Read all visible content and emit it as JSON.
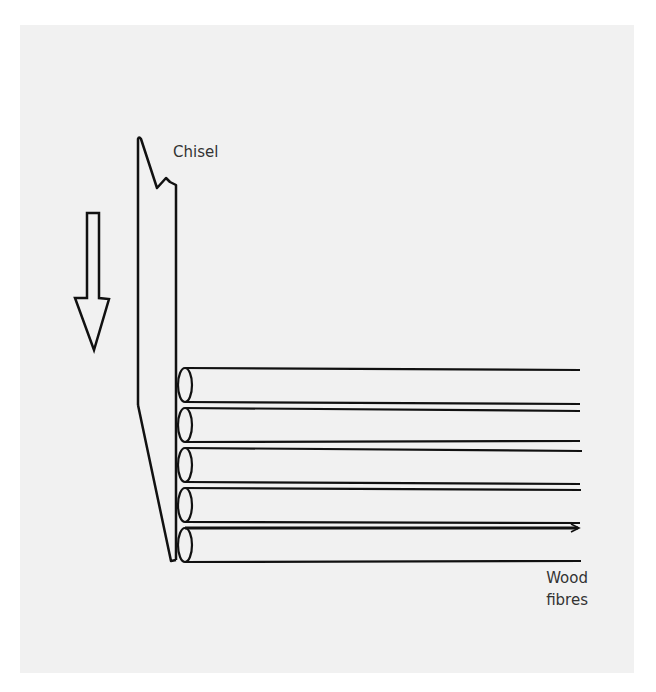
{
  "diagram": {
    "type": "illustration",
    "labels": {
      "chisel": "Chisel",
      "wood_line1": "Wood",
      "wood_line2": "fibres"
    },
    "elements": {
      "direction_arrow": "downward",
      "fibre_count": 5
    },
    "colors": {
      "background": "#f1f1f1",
      "stroke": "#111111",
      "text": "#333333"
    }
  }
}
